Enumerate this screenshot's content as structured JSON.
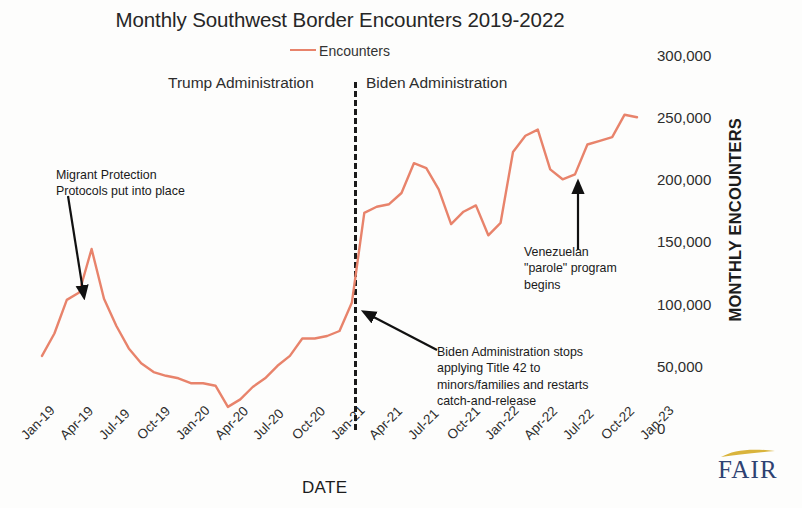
{
  "chart_data": {
    "type": "line",
    "title": "Monthly Southwest Border Encounters 2019-2022",
    "xlabel": "DATE",
    "ylabel": "MONTHLY ENCOUNTERS",
    "ylim": [
      0,
      300000
    ],
    "yticks": [
      "0",
      "50,000",
      "100,000",
      "150,000",
      "200,000",
      "250,000",
      "300,000"
    ],
    "ytick_values": [
      0,
      50000,
      100000,
      150000,
      200000,
      250000,
      300000
    ],
    "grid": false,
    "legend": [
      {
        "name": "Encounters",
        "color": "#e8836b"
      }
    ],
    "legend_position": "top-center",
    "xticks": [
      "Jan-19",
      "Apr-19",
      "Jul-19",
      "Oct-19",
      "Jan-20",
      "Apr-20",
      "Jul-20",
      "Oct-20",
      "Jan-21",
      "Apr-21",
      "Jul-21",
      "Oct-21",
      "Jan-22",
      "Apr-22",
      "Jul-22",
      "Oct-22",
      "Jan-23"
    ],
    "x": [
      "Jan-19",
      "Feb-19",
      "Mar-19",
      "Apr-19",
      "May-19",
      "Jun-19",
      "Jul-19",
      "Aug-19",
      "Sep-19",
      "Oct-19",
      "Nov-19",
      "Dec-19",
      "Jan-20",
      "Feb-20",
      "Mar-20",
      "Apr-20",
      "May-20",
      "Jun-20",
      "Jul-20",
      "Aug-20",
      "Sep-20",
      "Oct-20",
      "Nov-20",
      "Dec-20",
      "Jan-21",
      "Feb-21",
      "Mar-21",
      "Apr-21",
      "May-21",
      "Jun-21",
      "Jul-21",
      "Aug-21",
      "Sep-21",
      "Oct-21",
      "Nov-21",
      "Dec-21",
      "Jan-22",
      "Feb-22",
      "Mar-22",
      "Apr-22",
      "May-22",
      "Jun-22",
      "Jul-22",
      "Aug-22",
      "Sep-22",
      "Oct-22",
      "Nov-22",
      "Dec-22",
      "Jan-23"
    ],
    "series": [
      {
        "name": "Encounters",
        "color": "#e8836b",
        "values": [
          58000,
          76000,
          103000,
          109000,
          144000,
          104000,
          82000,
          64000,
          52000,
          45000,
          42000,
          40000,
          36000,
          36000,
          34000,
          17000,
          23000,
          33000,
          40000,
          50000,
          58000,
          72000,
          72000,
          74000,
          78000,
          101000,
          173000,
          178000,
          180000,
          189000,
          213000,
          209000,
          192000,
          164000,
          174000,
          179000,
          155000,
          165000,
          222000,
          235000,
          240000,
          208000,
          200000,
          204000,
          228000,
          231000,
          234000,
          252000,
          250000
        ]
      }
    ],
    "annotations": [
      {
        "id": "migrant-protection-protocols",
        "text": "Migrant Protection\nProtocols put into place",
        "target_x": "Mar-19",
        "target_y": 103000
      },
      {
        "id": "title-42-minors-families",
        "text": "Biden Administration stops\napplying Title 42 to\nminors/families and restarts\ncatch-and-release",
        "target_x": "Jan-21",
        "target_y": 78000
      },
      {
        "id": "venezuelan-parole-program",
        "text": "Venezuelan\n\"parole\" program\nbegins",
        "target_x": "Aug-22",
        "target_y": 204000
      }
    ],
    "regions": [
      {
        "id": "trump-administration",
        "label": "Trump Administration",
        "from": "Jan-19",
        "to": "Jan-21"
      },
      {
        "id": "biden-administration",
        "label": "Biden Administration",
        "from": "Jan-21",
        "to": "Jan-23"
      }
    ],
    "divider": {
      "at_x": "Jan-21",
      "style": "dashed",
      "color": "#1a1a1a"
    }
  },
  "logo": {
    "text": "FAIR",
    "color": "#2e4272",
    "swoosh_color": "#d9b43c"
  }
}
